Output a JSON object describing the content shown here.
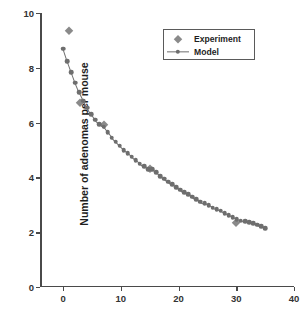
{
  "chart_data": {
    "type": "scatter",
    "title": "",
    "xlabel": "",
    "ylabel": "Number of adenomas per mouse",
    "xlim": [
      -4,
      40
    ],
    "ylim": [
      0,
      10
    ],
    "xticks": [
      0,
      10,
      20,
      30,
      40
    ],
    "yticks": [
      0,
      2,
      4,
      6,
      8,
      10
    ],
    "grid": false,
    "legend_position": "upper-right",
    "series": [
      {
        "name": "Experiment",
        "marker": "diamond",
        "color": "#8a8a8a",
        "line": false,
        "x": [
          1,
          3,
          7,
          15,
          30
        ],
        "y": [
          9.35,
          6.7,
          5.9,
          4.3,
          2.35
        ]
      },
      {
        "name": "Model",
        "marker": "circle",
        "color": "#6e6e6e",
        "line": true,
        "x": [
          0,
          0.7,
          1.4,
          2.1,
          2.8,
          3.5,
          4.2,
          4.9,
          5.6,
          6.3,
          7.0,
          7.7,
          8.4,
          9.1,
          9.8,
          10.5,
          11.2,
          11.9,
          12.6,
          13.3,
          14.0,
          14.7,
          15.4,
          16.1,
          16.8,
          17.5,
          18.2,
          18.9,
          19.6,
          20.3,
          21.0,
          21.7,
          22.4,
          23.1,
          23.8,
          24.5,
          25.2,
          25.9,
          26.6,
          27.3,
          28.0,
          28.7,
          29.4,
          30.1,
          30.8,
          31.5,
          32.2,
          32.9,
          33.6,
          34.3,
          35.0
        ],
        "y": [
          8.7,
          8.25,
          7.85,
          7.45,
          7.1,
          6.8,
          6.55,
          6.3,
          6.1,
          5.95,
          5.85,
          5.65,
          5.45,
          5.3,
          5.15,
          5.0,
          4.88,
          4.75,
          4.62,
          4.5,
          4.4,
          4.3,
          4.3,
          4.18,
          4.05,
          3.95,
          3.85,
          3.75,
          3.65,
          3.55,
          3.45,
          3.38,
          3.3,
          3.2,
          3.12,
          3.05,
          2.98,
          2.9,
          2.85,
          2.78,
          2.7,
          2.62,
          2.55,
          2.48,
          2.42,
          2.4,
          2.36,
          2.32,
          2.28,
          2.22,
          2.15
        ]
      }
    ]
  },
  "legend": {
    "items": [
      {
        "label": "Experiment",
        "symbol": "diamond-marker"
      },
      {
        "label": "Model",
        "symbol": "line-circle-marker"
      }
    ]
  },
  "axes": {
    "y_title": "Number of adenomas per mouse",
    "y_tick_labels": [
      "10",
      "8",
      "6",
      "4",
      "2",
      "0"
    ],
    "x_tick_labels": [
      "0",
      "10",
      "20",
      "30",
      "40"
    ]
  },
  "caption": {
    "text": ""
  }
}
